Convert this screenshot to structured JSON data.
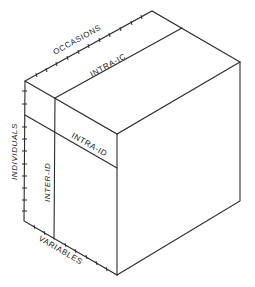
{
  "diagram": {
    "type": "data-box (three-mode cube)",
    "axes": {
      "occasions": "OCCASIONS",
      "individuals": "INDIVIDUALS",
      "variables": "VARIABLES"
    },
    "regions": {
      "intra_ic": "INTRA-IC",
      "intra_id": "INTRA-ID",
      "inter_id": "INTER-ID"
    },
    "colors": {
      "line": "#2a2a2a",
      "background": "#ffffff"
    }
  }
}
